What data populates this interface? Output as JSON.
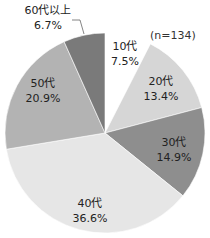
{
  "chart_data": {
    "type": "pie",
    "title": "",
    "note": "(n=134)",
    "start_angle": "12 o'clock",
    "direction": "clockwise",
    "categories": [
      "10代",
      "20代",
      "30代",
      "40代",
      "50代",
      "60代以上"
    ],
    "values": [
      7.5,
      13.4,
      14.9,
      36.6,
      20.9,
      6.7
    ],
    "value_labels": [
      "7.5%",
      "13.4%",
      "14.9%",
      "36.6%",
      "20.9%",
      "6.7%"
    ],
    "colors": [
      "#ffffff",
      "#d6d6d6",
      "#8e8e8e",
      "#e6e6e6",
      "#b3b3b3",
      "#7a7a7a"
    ],
    "legend": "none",
    "label_position": "inside (60代以上 outside with leader line)"
  },
  "labels": {
    "n": "(n=134)",
    "s10": {
      "cat": "10代",
      "pct": "7.5%"
    },
    "s20": {
      "cat": "20代",
      "pct": "13.4%"
    },
    "s30": {
      "cat": "30代",
      "pct": "14.9%"
    },
    "s40": {
      "cat": "40代",
      "pct": "36.6%"
    },
    "s50": {
      "cat": "50代",
      "pct": "20.9%"
    },
    "s60": {
      "cat": "60代以上",
      "pct": "6.7%"
    }
  }
}
